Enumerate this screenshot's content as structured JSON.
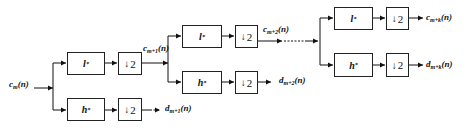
{
  "diagram": {
    "type": "wavelet-decomposition-filter-bank",
    "input": {
      "base": "c",
      "sub": "m",
      "arg": "(n)"
    },
    "filters": {
      "lowpass": {
        "name": "l",
        "sup": "*"
      },
      "highpass": {
        "name": "h",
        "sup": "*"
      },
      "downsample": {
        "arrow": "↓",
        "factor": "2"
      }
    },
    "stages": [
      {
        "id": 1,
        "low_out": {
          "base": "c",
          "sub": "m+1",
          "arg": "(n)"
        },
        "high_out": {
          "base": "d",
          "sub": "m+1",
          "arg": "(n)"
        }
      },
      {
        "id": 2,
        "low_out": {
          "base": "c",
          "sub": "m+2",
          "arg": "(n)"
        },
        "high_out": {
          "base": "d",
          "sub": "m+2",
          "arg": "(n)"
        }
      },
      {
        "id": 3,
        "low_out": {
          "base": "c",
          "sub": "m+k",
          "arg": "(n)"
        },
        "high_out": {
          "base": "d",
          "sub": "m+k",
          "arg": "(n)"
        }
      }
    ]
  }
}
